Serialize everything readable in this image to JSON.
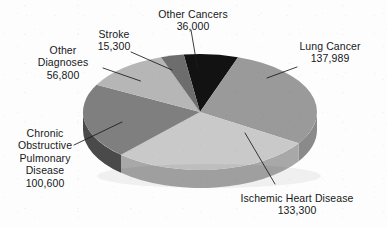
{
  "chart_data": {
    "type": "pie",
    "title": "",
    "subtitle": "",
    "xlabel": "",
    "ylabel": "",
    "legend_position": "none",
    "grid": false,
    "three_d": true,
    "label_format": "name + value on separate lines, leader lines to slices",
    "categories": [
      "Lung Cancer",
      "Ischemic Heart Disease",
      "Chronic Obstructive Pulmonary Disease",
      "Other Diagnoses",
      "Stroke",
      "Other Cancers"
    ],
    "values": [
      137989,
      133300,
      100600,
      56800,
      15300,
      36000
    ],
    "value_labels": [
      "137,989",
      "133,300",
      "100,600",
      "56,800",
      "15,300",
      "36,000"
    ],
    "total": 479989,
    "slices": [
      {
        "name": "Lung Cancer",
        "value": 137989,
        "value_label": "137,989",
        "percent": 28.7,
        "color": "#9a9a9a",
        "side_color": "#8a8a8a",
        "label_lines": [
          "Lung Cancer",
          "137,989"
        ]
      },
      {
        "name": "Ischemic Heart Disease",
        "value": 133300,
        "value_label": "133,300",
        "percent": 27.8,
        "color": "#c9c9c9",
        "side_color": "#a8a8a8",
        "label_lines": [
          "Ischemic Heart Disease",
          "133,300"
        ]
      },
      {
        "name": "Chronic Obstructive Pulmonary Disease",
        "value": 100600,
        "value_label": "100,600",
        "percent": 21.0,
        "color": "#7f7f7f",
        "side_color": "#4a4a4a",
        "label_lines": [
          "Chronic",
          "Obstructive",
          "Pulmonary",
          "Disease",
          "100,600"
        ]
      },
      {
        "name": "Other Diagnoses",
        "value": 56800,
        "value_label": "56,800",
        "percent": 11.8,
        "color": "#b6b6b6",
        "side_color": "#9d9d9d",
        "label_lines": [
          "Other",
          "Diagnoses",
          "56,800"
        ]
      },
      {
        "name": "Stroke",
        "value": 15300,
        "value_label": "15,300",
        "percent": 3.2,
        "color": "#6d6d6d",
        "side_color": "#5a5a5a",
        "label_lines": [
          "Stroke",
          "15,300"
        ]
      },
      {
        "name": "Other Cancers",
        "value": 36000,
        "value_label": "36,000",
        "percent": 7.5,
        "color": "#121212",
        "side_color": "#0c0c0c",
        "label_lines": [
          "Other Cancers",
          "36,000"
        ]
      }
    ]
  },
  "labels": {
    "other_cancers": {
      "name": "Other Cancers",
      "value": "36,000"
    },
    "stroke": {
      "name": "Stroke",
      "value": "15,300"
    },
    "other_diagnoses": {
      "name_line1": "Other",
      "name_line2": "Diagnoses",
      "value": "56,800"
    },
    "copd": {
      "name_line1": "Chronic",
      "name_line2": "Obstructive",
      "name_line3": "Pulmonary",
      "name_line4": "Disease",
      "value": "100,600"
    },
    "lung_cancer": {
      "name": "Lung Cancer",
      "value": "137,989"
    },
    "ischemic": {
      "name": "Ischemic Heart Disease",
      "value": "133,300"
    }
  }
}
